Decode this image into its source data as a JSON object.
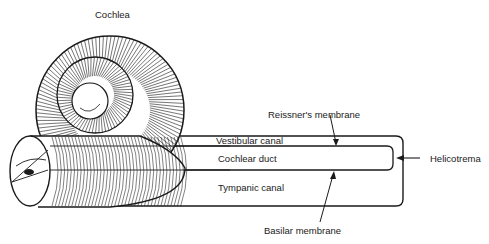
{
  "title": "Cochlea",
  "labels": {
    "cochlea": "Cochlea",
    "vestibular_canal": "Vestibular canal",
    "cochlear_duct": "Cochlear duct",
    "tympanic_canal": "Tympanic canal",
    "reissners_membrane": "Reissner's membrane",
    "basilar_membrane": "Basilar membrane",
    "helicotrema": "Helicotrema"
  },
  "colors": {
    "ink": "#1a1a1a",
    "background": "#ffffff"
  }
}
